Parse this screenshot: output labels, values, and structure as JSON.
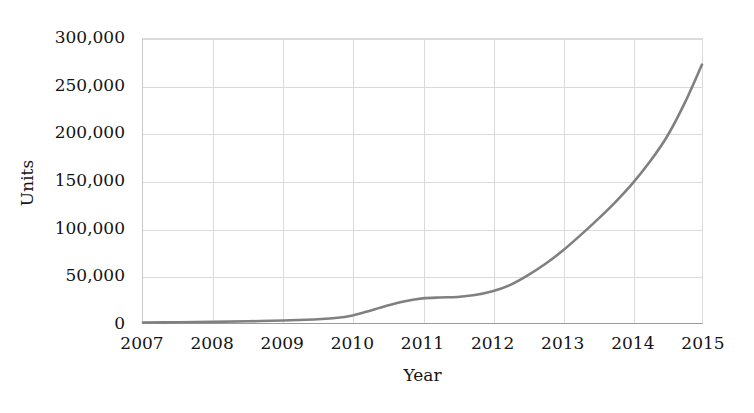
{
  "chart_data": {
    "type": "line",
    "title": "",
    "xlabel": "Year",
    "ylabel": "Units",
    "xlim": [
      2007,
      2015
    ],
    "ylim": [
      0,
      300000
    ],
    "grid": true,
    "legend": "none",
    "line_color": "#808080",
    "x_tick_labels": [
      "2007",
      "2008",
      "2009",
      "2010",
      "2011",
      "2012",
      "2013",
      "2014",
      "2015"
    ],
    "x_ticks": [
      2007,
      2008,
      2009,
      2010,
      2011,
      2012,
      2013,
      2014,
      2015
    ],
    "y_tick_labels": [
      "0",
      "50,000",
      "100,000",
      "150,000",
      "200,000",
      "250,000",
      "300,000"
    ],
    "y_ticks": [
      0,
      50000,
      100000,
      150000,
      200000,
      250000,
      300000
    ],
    "series": [
      {
        "name": "Units",
        "x": [
          2007,
          2007.5,
          2008,
          2008.5,
          2009,
          2009.25,
          2009.5,
          2009.75,
          2010,
          2010.25,
          2010.5,
          2010.75,
          2011,
          2011.25,
          2011.5,
          2011.75,
          2012,
          2012.25,
          2012.5,
          2012.75,
          2013,
          2013.25,
          2013.5,
          2013.75,
          2014,
          2014.25,
          2014.5,
          2014.75,
          2015
        ],
        "values": [
          500,
          800,
          1200,
          1800,
          2600,
          3200,
          4000,
          5200,
          8000,
          13000,
          18500,
          23000,
          26000,
          27000,
          27500,
          29500,
          33500,
          40000,
          50000,
          62000,
          76000,
          92000,
          109000,
          127000,
          147000,
          170000,
          197000,
          232000,
          273000
        ]
      }
    ]
  }
}
